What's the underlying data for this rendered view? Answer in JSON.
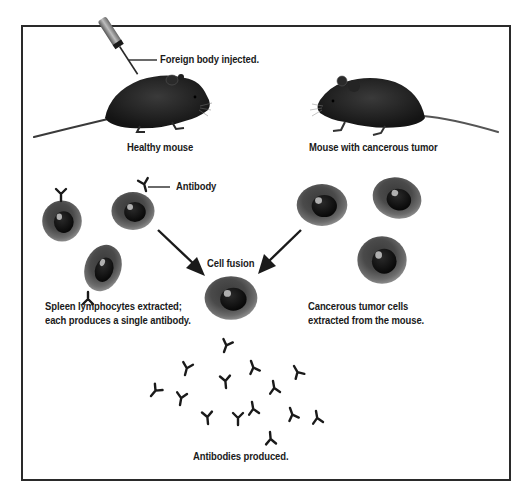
{
  "diagram": {
    "topic": "Monoclonal antibody production (hybridoma technique)",
    "labels": {
      "injection": "Foreign body injected.",
      "healthy_mouse": "Healthy mouse",
      "tumor_mouse": "Mouse with cancerous tumor",
      "antibody": "Antibody",
      "cell_fusion": "Cell fusion",
      "spleen_line1": "Spleen lymphocytes extracted;",
      "spleen_line2": "each produces a single antibody.",
      "tumor_cells_line1": "Cancerous tumor cells",
      "tumor_cells_line2": "extracted from the mouse.",
      "antibodies_produced": "Antibodies produced."
    },
    "elements": {
      "syringe": "syringe-icon",
      "mice": [
        "healthy-mouse",
        "tumor-mouse"
      ],
      "lymphocyte_count": 3,
      "tumor_cell_count": 3,
      "hybrid_cell_count": 1,
      "antibody_count": 15,
      "arrows": [
        "lymphocyte-to-hybrid-arrow",
        "tumor-cell-to-hybrid-arrow"
      ]
    },
    "colors": {
      "frame": "#2a2a2a",
      "cell_outer": "#5a5a5a",
      "cell_nucleus": "#111111",
      "text": "#1a1a1a",
      "background": "#ffffff"
    }
  }
}
